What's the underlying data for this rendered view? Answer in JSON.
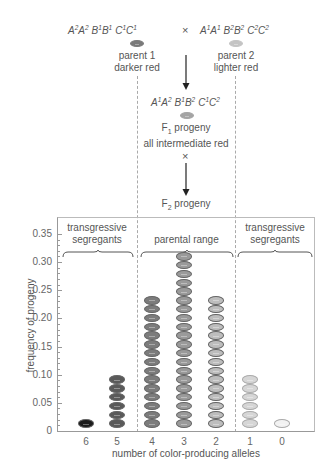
{
  "cross": {
    "parent1": {
      "genotype": [
        [
          "A",
          "2"
        ],
        [
          "A",
          "2"
        ],
        [
          "B",
          "1"
        ],
        [
          "B",
          "1"
        ],
        [
          "C",
          "1"
        ],
        [
          "C",
          "1"
        ]
      ],
      "label_line1": "parent 1",
      "label_line2": "darker red",
      "color": "#7a7a7a"
    },
    "cross_symbol": "×",
    "parent2": {
      "genotype": [
        [
          "A",
          "1"
        ],
        [
          "A",
          "1"
        ],
        [
          "B",
          "2"
        ],
        [
          "B",
          "2"
        ],
        [
          "C",
          "2"
        ],
        [
          "C",
          "2"
        ]
      ],
      "label_line1": "parent 2",
      "label_line2": "lighter red",
      "color": "#c4c4c4"
    },
    "f1": {
      "genotype": [
        [
          "A",
          "1"
        ],
        [
          "A",
          "2"
        ],
        [
          "B",
          "1"
        ],
        [
          "B",
          "2"
        ],
        [
          "C",
          "1"
        ],
        [
          "C",
          "2"
        ]
      ],
      "label_prefix": "F",
      "label_sub": "1",
      "label_suffix": " progeny",
      "label_line2": "all intermediate red",
      "color": "#a4a4a4"
    },
    "selfing_symbol": "×",
    "f2": {
      "label_prefix": "F",
      "label_sub": "2",
      "label_suffix": " progeny"
    }
  },
  "chart_data": {
    "type": "bar",
    "title": "",
    "xlabel": "number of color-producing alleles",
    "ylabel": "frequency of progeny",
    "categories": [
      "6",
      "5",
      "4",
      "3",
      "2",
      "1",
      "0"
    ],
    "values": [
      0.0156,
      0.0938,
      0.2344,
      0.3125,
      0.2344,
      0.0938,
      0.0156
    ],
    "oval_counts": [
      1,
      6,
      15,
      20,
      15,
      6,
      1
    ],
    "oval_colors": [
      "#1c1c1c",
      "#5a5a5a",
      "#7c7c7c",
      "#9a9a9a",
      "#bdbdbd",
      "#d6d6d6",
      "#f2f2f2"
    ],
    "ylim": [
      0,
      0.38
    ],
    "yticks": [
      "0",
      "0.05",
      "0.10",
      "0.15",
      "0.20",
      "0.25",
      "0.30",
      "0.35"
    ],
    "grid": false,
    "regions": [
      {
        "label_line1": "transgressive",
        "label_line2": "segregants"
      },
      {
        "label_line1": "parental range",
        "label_line2": ""
      },
      {
        "label_line1": "transgressive",
        "label_line2": "segregants"
      }
    ]
  }
}
